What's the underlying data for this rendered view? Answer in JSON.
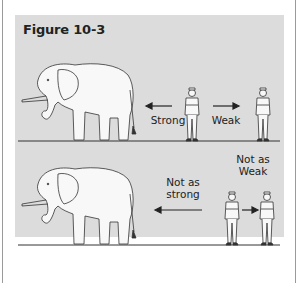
{
  "figure": {
    "title": "Figure 10-3",
    "panels": [
      {
        "id": "top",
        "labels": {
          "left_arrow": "Strong",
          "right_arrow": "Weak"
        },
        "figures": [
          "elephant",
          "person-near",
          "person-far"
        ]
      },
      {
        "id": "bottom",
        "labels": {
          "left_arrow": "Not as strong",
          "right_arrow": "Not as Weak"
        },
        "label_lines": {
          "left_line1": "Not as",
          "left_line2": "strong",
          "right_line1": "Not as",
          "right_line2": "Weak"
        },
        "figures": [
          "elephant",
          "person-near",
          "person-far"
        ]
      }
    ],
    "colors": {
      "panel_bg": "#dcdcdc",
      "line": "#333333",
      "text": "#222222"
    }
  }
}
